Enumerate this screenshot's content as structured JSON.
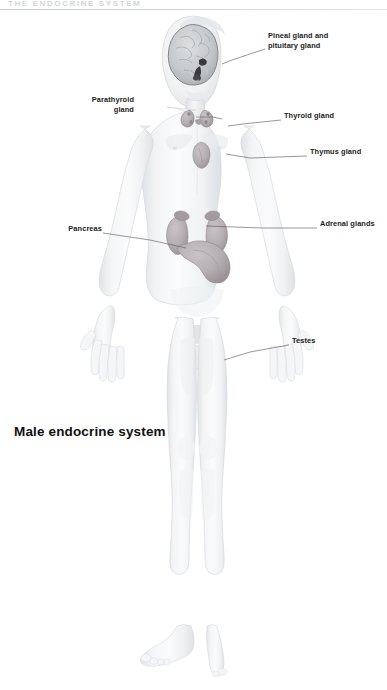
{
  "header": {
    "running_title": "The endocrine system"
  },
  "caption": {
    "text": "Male endocrine system"
  },
  "figure": {
    "render_style": "pale-grey-airbrush-anatomical-illustration",
    "colors": {
      "skin_light": "#f6f7f8",
      "skin_shadow": "#e3e6e9",
      "skin_midtone": "#eceef0",
      "outline": "#d2d6da",
      "organ_fill": "#b9b2b6",
      "organ_shadow": "#9d959b",
      "brain_fill": "#cfd2d4",
      "brain_dark": "#3a3a3c",
      "leader_line": "#5d5f63",
      "label_text": "#1c1c1c",
      "header_text": "#d4d6da",
      "rule": "#c8cbd0",
      "page_background": "#ffffff"
    }
  },
  "labels": [
    {
      "id": "pineal-pituitary",
      "name": "Pineal gland and\npituitary gland",
      "align": "left",
      "x": 268,
      "y": 26,
      "leader": [
        [
          265,
          39
        ],
        [
          232,
          50
        ],
        [
          222,
          54
        ]
      ]
    },
    {
      "id": "parathyroid",
      "name": "Parathyroid\ngland",
      "align": "right",
      "x": 134,
      "y": 90,
      "leader": [
        [
          196,
          107
        ],
        [
          213,
          107
        ],
        [
          222,
          109
        ]
      ]
    },
    {
      "id": "thyroid",
      "name": "Thyroid gland",
      "align": "left",
      "x": 284,
      "y": 106,
      "leader": [
        [
          281,
          110
        ],
        [
          243,
          114
        ],
        [
          228,
          116
        ]
      ]
    },
    {
      "id": "thymus",
      "name": "Thymus gland",
      "align": "left",
      "x": 310,
      "y": 142,
      "leader": [
        [
          307,
          146
        ],
        [
          250,
          148
        ],
        [
          226,
          144
        ]
      ]
    },
    {
      "id": "pancreas",
      "name": "Pancreas",
      "align": "right",
      "x": 62,
      "y": 219,
      "leader": [
        [
          103,
          223
        ],
        [
          150,
          230
        ],
        [
          186,
          238
        ]
      ]
    },
    {
      "id": "adrenal",
      "name": "Adrenal glands",
      "align": "left",
      "x": 320,
      "y": 214,
      "leader": [
        [
          317,
          218
        ],
        [
          262,
          218
        ],
        [
          206,
          216
        ]
      ]
    },
    {
      "id": "testes",
      "name": "Testes",
      "align": "left",
      "x": 292,
      "y": 331,
      "leader": [
        [
          289,
          335
        ],
        [
          250,
          342
        ],
        [
          224,
          350
        ]
      ]
    }
  ]
}
